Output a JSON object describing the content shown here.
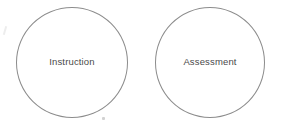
{
  "canvas": {
    "width": 282,
    "height": 130,
    "background_color": "#ffffff"
  },
  "diagram": {
    "type": "two-circles",
    "stroke_color": "#8c8c8c",
    "label_color": "#4a4a4a",
    "nodes": [
      {
        "id": "instruction",
        "label": "Instruction",
        "shape": "circle",
        "fill": "none"
      },
      {
        "id": "assessment",
        "label": "Assessment",
        "shape": "circle",
        "fill": "none"
      }
    ],
    "artifacts": [
      {
        "id": "speck-below-instruction",
        "kind": "scan-speck"
      },
      {
        "id": "speck-top-left",
        "kind": "scan-smudge"
      }
    ]
  }
}
